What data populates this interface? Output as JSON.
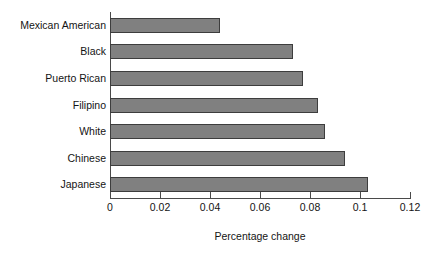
{
  "chart_data": {
    "type": "bar",
    "orientation": "horizontal",
    "title": "",
    "xlabel": "Percentage change",
    "ylabel": "",
    "categories": [
      "Mexican American",
      "Black",
      "Puerto Rican",
      "Filipino",
      "White",
      "Chinese",
      "Japanese"
    ],
    "values": [
      0.044,
      0.073,
      0.077,
      0.083,
      0.086,
      0.094,
      0.103
    ],
    "xlim": [
      0,
      0.12
    ],
    "xticks": [
      0,
      0.02,
      0.04,
      0.06,
      0.08,
      0.1,
      0.12
    ],
    "xtick_labels": [
      "0",
      "0.02",
      "0.04",
      "0.06",
      "0.08",
      "0.1",
      "0.12"
    ],
    "grid": false,
    "legend": null,
    "bar_color": "#808080",
    "bar_edge_color": "#3d3d3d",
    "axis_color": "#4a4a4a",
    "background": "#ffffff"
  }
}
